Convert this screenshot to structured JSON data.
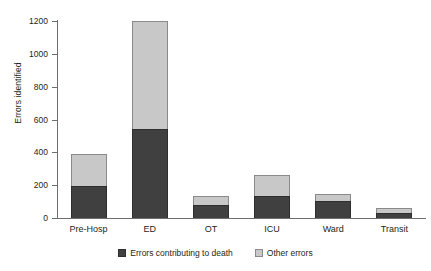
{
  "chart_data": {
    "type": "bar",
    "stacked": true,
    "title": "",
    "xlabel": "",
    "ylabel": "Errors identified",
    "ylim": [
      0,
      1200
    ],
    "yticks": [
      0,
      200,
      400,
      600,
      800,
      1000,
      1200
    ],
    "ytick_labels": [
      "0",
      "200",
      "400",
      "600",
      "800",
      "1000",
      "1200"
    ],
    "grid": false,
    "legend_position": "bottom-center",
    "categories": [
      "Pre-Hosp",
      "ED",
      "OT",
      "ICU",
      "Ward",
      "Transit"
    ],
    "series": [
      {
        "name": "Errors contributing to death",
        "color": "#404040",
        "values": [
          195,
          545,
          78,
          135,
          105,
          30
        ]
      },
      {
        "name": "Other errors",
        "color": "#c8c8c8",
        "values": [
          195,
          655,
          57,
          125,
          43,
          30
        ]
      }
    ],
    "totals": [
      390,
      1200,
      135,
      260,
      148,
      60
    ]
  },
  "colors": {
    "series_dark": "#404040",
    "series_light": "#c8c8c8",
    "axis": "#6e6e6e",
    "text": "#231f20",
    "background": "#ffffff"
  }
}
